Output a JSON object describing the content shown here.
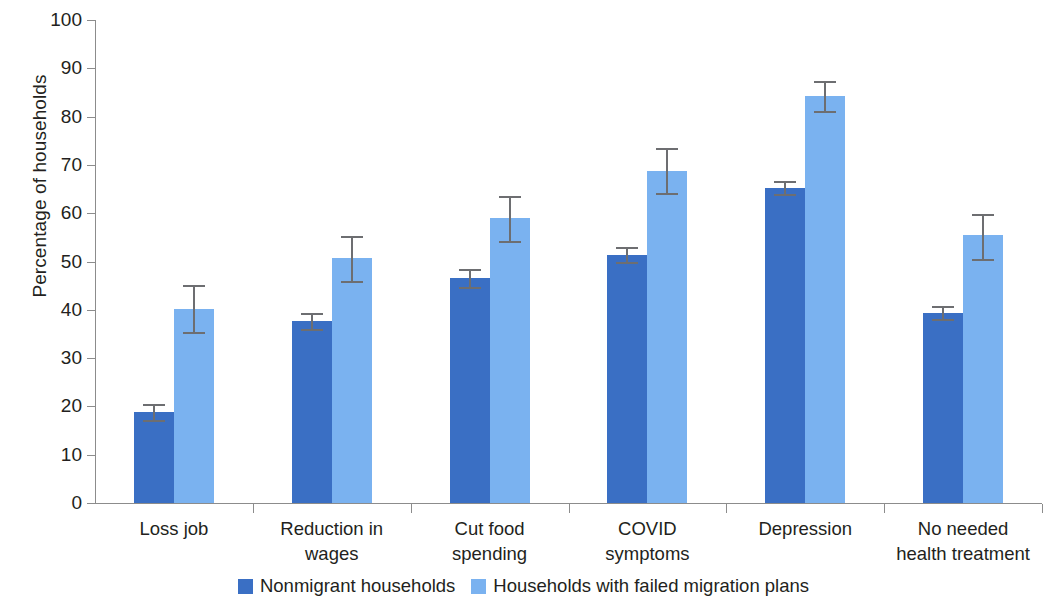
{
  "chart_data": {
    "type": "bar",
    "title": "",
    "xlabel": "",
    "ylabel": "Percentage of households",
    "ylim": [
      0,
      100
    ],
    "yticks": [
      0,
      10,
      20,
      30,
      40,
      50,
      60,
      70,
      80,
      90,
      100
    ],
    "grid": false,
    "legend_position": "bottom",
    "categories": [
      "Loss job",
      "Reduction in wages",
      "Cut food spending",
      "COVID symptoms",
      "Depression",
      "No needed health treatment"
    ],
    "category_lines": [
      [
        "Loss job",
        ""
      ],
      [
        "Reduction in",
        "wages"
      ],
      [
        "Cut food",
        "spending"
      ],
      [
        "COVID",
        "symptoms"
      ],
      [
        "Depression",
        ""
      ],
      [
        "No needed",
        "health treatment"
      ]
    ],
    "series": [
      {
        "name": "Nonmigrant households",
        "color": "#3a6fc4",
        "values": [
          18.8,
          37.6,
          46.6,
          51.3,
          65.2,
          39.3
        ],
        "err_low": [
          17.2,
          36.0,
          44.8,
          49.8,
          63.9,
          38.0
        ],
        "err_high": [
          20.4,
          39.3,
          48.4,
          53.0,
          66.7,
          40.8
        ]
      },
      {
        "name": "Households with failed migration plans",
        "color": "#7ab2f0",
        "values": [
          40.2,
          50.7,
          59.0,
          68.8,
          84.3,
          55.4
        ],
        "err_low": [
          35.4,
          46.0,
          54.2,
          64.1,
          81.2,
          50.6
        ],
        "err_high": [
          45.2,
          55.2,
          63.5,
          73.4,
          87.4,
          59.8
        ]
      }
    ]
  },
  "legend": {
    "items": [
      {
        "label": "Nonmigrant households",
        "color": "#3a6fc4"
      },
      {
        "label": "Households with failed migration plans",
        "color": "#7ab2f0"
      }
    ]
  },
  "axis": {
    "y_title": "Percentage of households"
  }
}
